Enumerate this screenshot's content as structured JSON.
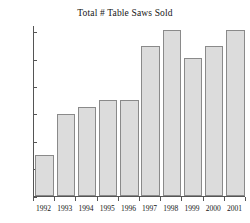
{
  "chart_data": {
    "type": "bar",
    "title": "Total # Table Saws Sold",
    "xlabel": "",
    "ylabel": "",
    "categories": [
      "1992",
      "1993",
      "1994",
      "1995",
      "1996",
      "1997",
      "1998",
      "1999",
      "2000",
      "2001"
    ],
    "values": [
      30,
      60,
      65,
      70,
      70,
      110,
      121,
      101,
      110,
      121
    ],
    "ylim": [
      0,
      125
    ],
    "yticks": [
      0,
      20,
      40,
      60,
      80,
      100,
      120
    ],
    "ytick_labels": [
      "0",
      "20",
      "40",
      "60",
      "80",
      "100",
      "120"
    ],
    "grid": false,
    "legend": false,
    "bar_fill_color": "#dcdcdc",
    "bar_border_color": "#8a8a8a",
    "axis_color": "#555555",
    "background_color": "#ffffff"
  }
}
